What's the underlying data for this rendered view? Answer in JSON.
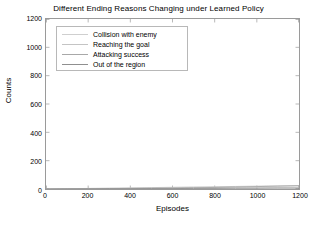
{
  "chart_data": {
    "type": "line",
    "title": "Different Ending Reasons Changing under Learned Policy",
    "xlabel": "Episodes",
    "ylabel": "Counts",
    "xlim": [
      0,
      1200
    ],
    "ylim": [
      0,
      1200
    ],
    "xticks": [
      0,
      200,
      400,
      600,
      800,
      1000,
      1200
    ],
    "yticks": [
      0,
      200,
      400,
      600,
      800,
      1000,
      1200
    ],
    "grid": false,
    "legend_position": "upper-left-inside",
    "x": [
      0,
      100,
      200,
      300,
      400,
      500,
      600,
      700,
      800,
      900,
      1000,
      1100,
      1200
    ],
    "series": [
      {
        "name": "Collision with enemy",
        "color": "#cfcfcf",
        "values": [
          0,
          1,
          2,
          3,
          4,
          5,
          6,
          7,
          8,
          9,
          10,
          11,
          12
        ]
      },
      {
        "name": "Reaching the goal",
        "color": "#c4c4c4",
        "values": [
          0,
          2,
          4,
          6,
          8,
          10,
          12,
          14,
          16,
          18,
          20,
          22,
          24
        ]
      },
      {
        "name": "Attacking success",
        "color": "#a8a8a8",
        "values": [
          0,
          1,
          2,
          3,
          4,
          5,
          7,
          9,
          11,
          14,
          17,
          20,
          23
        ]
      },
      {
        "name": "Out of the region",
        "color": "#8f8f8f",
        "values": [
          0,
          1,
          1,
          2,
          2,
          3,
          3,
          4,
          4,
          5,
          5,
          6,
          6
        ]
      }
    ]
  }
}
